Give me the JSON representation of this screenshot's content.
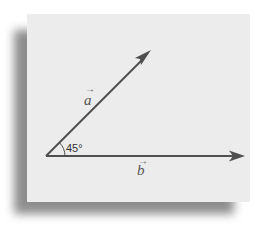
{
  "diagram": {
    "vectors": [
      {
        "id": "a",
        "label": "a",
        "arrow_glyph": "→",
        "angle_deg": 45
      },
      {
        "id": "b",
        "label": "b",
        "arrow_glyph": "→",
        "angle_deg": 0
      }
    ],
    "angle": {
      "label": "45°",
      "value": 45,
      "unit": "degrees"
    }
  },
  "colors": {
    "card_background": "#ececec",
    "vector_stroke": "#4f4f4f",
    "shadow": "#7a7a7a"
  }
}
